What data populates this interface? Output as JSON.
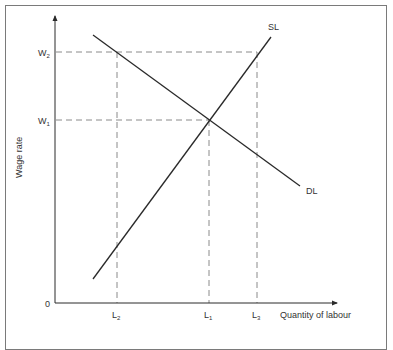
{
  "diagram": {
    "type": "labour market supply and demand",
    "y_axis": {
      "label": "Wage rate",
      "origin_label": "0",
      "ticks": [
        {
          "label": "W",
          "sub": "2",
          "y": 52
        },
        {
          "label": "W",
          "sub": "1",
          "y": 120
        }
      ]
    },
    "x_axis": {
      "label": "Quantity of labour",
      "ticks": [
        {
          "label": "L",
          "sub": "2",
          "x": 117
        },
        {
          "label": "L",
          "sub": "1",
          "x": 209
        },
        {
          "label": "L",
          "sub": "3",
          "x": 257
        }
      ]
    },
    "curves": [
      {
        "name": "SL",
        "label": "SL",
        "description": "Supply of labour, upward sloping"
      },
      {
        "name": "DL",
        "label": "DL",
        "description": "Demand for labour, downward sloping"
      }
    ],
    "equilibrium": {
      "wage": "W1",
      "quantity": "L1"
    },
    "colors": {
      "line": "#2a2a2a",
      "dashed": "#8a8a8a",
      "frame": "#7a7a7a",
      "text": "#333333"
    }
  }
}
